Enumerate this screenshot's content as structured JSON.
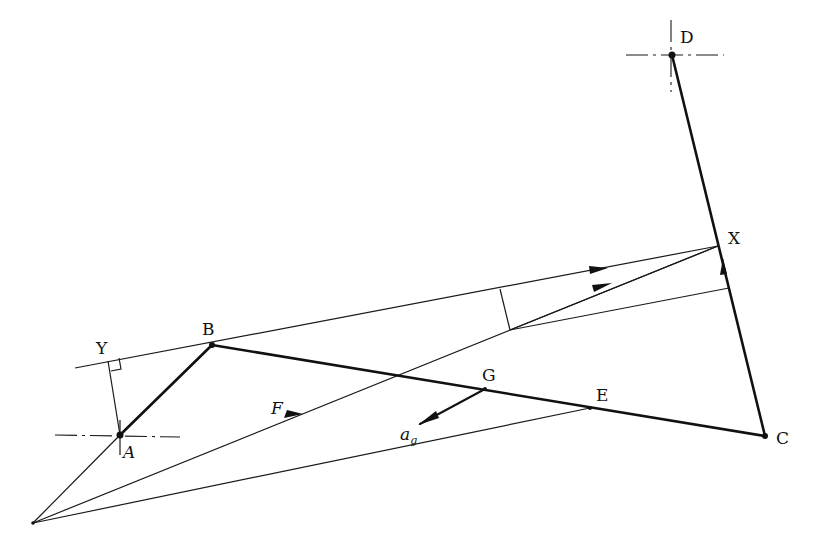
{
  "figure": {
    "type": "mechanism acceleration/force diagram (four-bar linkage)",
    "points": [
      {
        "id": "O",
        "label": "",
        "x": 33,
        "y": 523
      },
      {
        "id": "A",
        "label": "A",
        "x": 120,
        "y": 435
      },
      {
        "id": "B",
        "label": "B",
        "x": 212,
        "y": 345
      },
      {
        "id": "C",
        "label": "C",
        "x": 765,
        "y": 436
      },
      {
        "id": "D",
        "label": "D",
        "x": 672,
        "y": 55
      },
      {
        "id": "X",
        "label": "X",
        "x": 718,
        "y": 246
      },
      {
        "id": "Y",
        "label": "Y",
        "x": 110,
        "y": 361
      },
      {
        "id": "G",
        "label": "G",
        "x": 485,
        "y": 389
      },
      {
        "id": "E",
        "label": "E",
        "x": 590,
        "y": 408
      }
    ],
    "labels": {
      "A": "A",
      "B": "B",
      "C": "C",
      "D": "D",
      "X": "X",
      "Y": "Y",
      "G": "G",
      "E": "E",
      "force": "F",
      "accel_main": "a",
      "accel_sub": "g"
    },
    "links": [
      {
        "name": "crank AB",
        "from": "A",
        "to": "B"
      },
      {
        "name": "coupler BC",
        "from": "B",
        "to": "C"
      },
      {
        "name": "rocker CD",
        "from": "C",
        "to": "D"
      }
    ],
    "fixed_pivots": [
      "A",
      "D"
    ],
    "construction_lines": [
      "O-A extended to B direction",
      "O-X (line of force F)",
      "O-E",
      "Y-X line through B",
      "A-Y perpendicular to line YX",
      "perpendicular drop onto line YX near (500,290)",
      "line from (510,330) to rocker DC"
    ],
    "vectors": [
      {
        "name": "F",
        "description": "force along O-X"
      },
      {
        "name": "a_g",
        "description": "acceleration of G, pointing down-left"
      }
    ]
  }
}
